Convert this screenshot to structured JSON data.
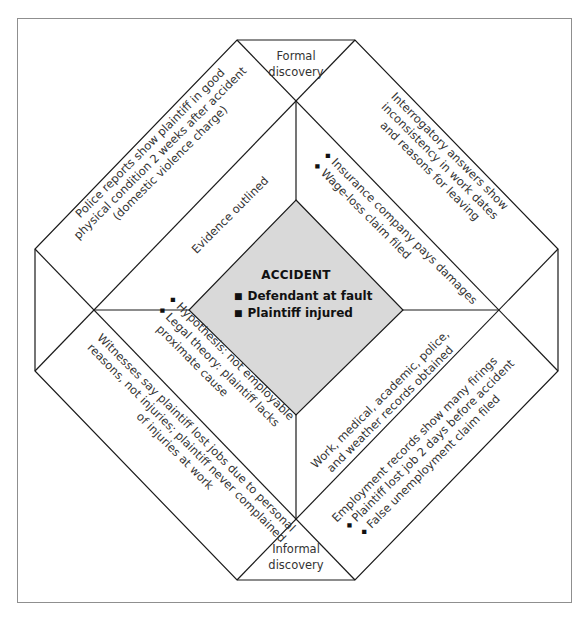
{
  "diagram": {
    "center": {
      "title": "ACCIDENT",
      "items": [
        "Defendant at fault",
        "Plaintiff injured"
      ],
      "fill": "#d9d9d9"
    },
    "top_label": {
      "line1": "Formal",
      "line2": "discovery"
    },
    "bottom_label": {
      "line1": "Informal",
      "line2": "discovery"
    },
    "outer": {
      "top_left": {
        "lines": [
          "Police reports show plaintiff in good",
          "physical condition 2 weeks after accident",
          "(domestic violence charge)"
        ]
      },
      "top_right": {
        "lines": [
          "Interrogatory answers show",
          "inconsistency in work dates",
          "and reasons for leaving"
        ]
      },
      "bottom_left": {
        "lines": [
          "Witnesses say plaintiff lost jobs due to personal",
          "reasons, not injuries; plaintiff never complained",
          "of injuries at work"
        ]
      },
      "bottom_right": {
        "lines": [
          "Employment records show many firings"
        ],
        "bullets": [
          "Plaintiff lost job 2 days before accident",
          "False unemployment claim filed"
        ]
      }
    },
    "inner": {
      "top_left": {
        "lines": [
          "Evidence outlined"
        ]
      },
      "top_right": {
        "bullets": [
          "Insurance company pays damages",
          "Wage-loss claim filed"
        ]
      },
      "bottom_left": {
        "bullets": [
          "Hypothesis: not employable",
          "Legal theory: plaintiff lacks"
        ],
        "continuation": "proximate cause"
      },
      "bottom_right": {
        "lines": [
          "Work, medical, academic, police,",
          "and weather records obtained"
        ]
      }
    },
    "colors": {
      "line": "#1a1a1a",
      "frame": "#8f8f8f",
      "text": "#333333"
    }
  }
}
